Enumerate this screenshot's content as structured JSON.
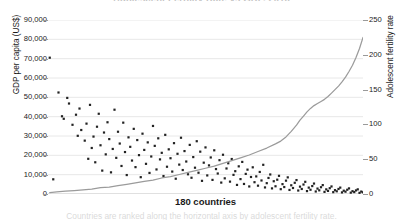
{
  "chart_data": {
    "type": "scatter",
    "title": "Adolescent Fertility Rate vs GDP, 2016",
    "xlabel": "180 countries",
    "ylabel": "GDP per capita (US$)",
    "ylabel_right": "Adolescent fertility rate",
    "caption": "Countries are ranked along the horizontal axis by adolescent fertility rate.",
    "grid": true,
    "legend_position": "none",
    "xlim": [
      0,
      180
    ],
    "ylim": [
      0,
      90000
    ],
    "ylim_right": [
      0,
      250
    ],
    "yticks": [
      "0",
      "10,000",
      "20,000",
      "30,000",
      "40,000",
      "50,000",
      "60,000",
      "70,000",
      "80,000",
      "90,000"
    ],
    "yticks_right": [
      "0",
      "50",
      "100",
      "150",
      "200",
      "250"
    ],
    "xticks": [],
    "series": [
      {
        "name": "GDP per capita (US$)",
        "type": "scatter",
        "axis": "left",
        "color": "#222222",
        "marker": "square",
        "points": [
          [
            1,
            70500
          ],
          [
            3,
            7600
          ],
          [
            6,
            52500
          ],
          [
            8,
            40200
          ],
          [
            9,
            38900
          ],
          [
            11,
            49700
          ],
          [
            12,
            46800
          ],
          [
            14,
            35800
          ],
          [
            16,
            41000
          ],
          [
            17,
            30100
          ],
          [
            18,
            44200
          ],
          [
            19,
            33100
          ],
          [
            21,
            27600
          ],
          [
            22,
            36400
          ],
          [
            23,
            18200
          ],
          [
            24,
            46100
          ],
          [
            25,
            23800
          ],
          [
            26,
            29700
          ],
          [
            27,
            16400
          ],
          [
            28,
            34800
          ],
          [
            29,
            41500
          ],
          [
            30,
            25200
          ],
          [
            31,
            12100
          ],
          [
            32,
            31800
          ],
          [
            33,
            20500
          ],
          [
            34,
            37100
          ],
          [
            35,
            28400
          ],
          [
            36,
            11200
          ],
          [
            37,
            23300
          ],
          [
            38,
            43600
          ],
          [
            39,
            18700
          ],
          [
            40,
            32200
          ],
          [
            41,
            26100
          ],
          [
            42,
            14500
          ],
          [
            43,
            36900
          ],
          [
            44,
            21700
          ],
          [
            45,
            9800
          ],
          [
            46,
            29300
          ],
          [
            47,
            24400
          ],
          [
            48,
            17300
          ],
          [
            49,
            33700
          ],
          [
            50,
            13900
          ],
          [
            51,
            27900
          ],
          [
            52,
            20100
          ],
          [
            53,
            8700
          ],
          [
            54,
            31200
          ],
          [
            55,
            22800
          ],
          [
            56,
            15600
          ],
          [
            57,
            26700
          ],
          [
            58,
            10900
          ],
          [
            59,
            19400
          ],
          [
            60,
            35200
          ],
          [
            61,
            24900
          ],
          [
            62,
            12700
          ],
          [
            63,
            28800
          ],
          [
            64,
            17900
          ],
          [
            65,
            21300
          ],
          [
            66,
            9300
          ],
          [
            67,
            30600
          ],
          [
            68,
            14100
          ],
          [
            69,
            23100
          ],
          [
            70,
            18500
          ],
          [
            71,
            11600
          ],
          [
            72,
            26300
          ],
          [
            73,
            7900
          ],
          [
            74,
            20800
          ],
          [
            75,
            15200
          ],
          [
            76,
            29100
          ],
          [
            77,
            12400
          ],
          [
            78,
            22200
          ],
          [
            79,
            16800
          ],
          [
            80,
            10200
          ],
          [
            81,
            25400
          ],
          [
            82,
            8400
          ],
          [
            83,
            19100
          ],
          [
            84,
            13600
          ],
          [
            85,
            27300
          ],
          [
            86,
            11000
          ],
          [
            87,
            21900
          ],
          [
            88,
            6800
          ],
          [
            89,
            16200
          ],
          [
            90,
            24100
          ],
          [
            91,
            9600
          ],
          [
            92,
            14800
          ],
          [
            93,
            18900
          ],
          [
            94,
            7300
          ],
          [
            95,
            22600
          ],
          [
            96,
            12900
          ],
          [
            97,
            10600
          ],
          [
            98,
            17500
          ],
          [
            99,
            5900
          ],
          [
            100,
            20300
          ],
          [
            101,
            8100
          ],
          [
            102,
            13200
          ],
          [
            103,
            15900
          ],
          [
            104,
            6400
          ],
          [
            105,
            18100
          ],
          [
            106,
            9900
          ],
          [
            107,
            11800
          ],
          [
            108,
            4700
          ],
          [
            109,
            14300
          ],
          [
            110,
            7700
          ],
          [
            111,
            16600
          ],
          [
            112,
            5200
          ],
          [
            113,
            10400
          ],
          [
            114,
            12600
          ],
          [
            115,
            3900
          ],
          [
            116,
            8800
          ],
          [
            117,
            13800
          ],
          [
            118,
            6100
          ],
          [
            119,
            9100
          ],
          [
            120,
            4300
          ],
          [
            121,
            11400
          ],
          [
            122,
            7000
          ],
          [
            123,
            15100
          ],
          [
            124,
            3400
          ],
          [
            125,
            5600
          ],
          [
            126,
            8300
          ],
          [
            127,
            10100
          ],
          [
            128,
            2900
          ],
          [
            129,
            6600
          ],
          [
            130,
            4000
          ],
          [
            131,
            7400
          ],
          [
            132,
            9400
          ],
          [
            133,
            2500
          ],
          [
            134,
            5100
          ],
          [
            135,
            3600
          ],
          [
            136,
            6900
          ],
          [
            137,
            8600
          ],
          [
            138,
            2100
          ],
          [
            139,
            4500
          ],
          [
            140,
            3100
          ],
          [
            141,
            5800
          ],
          [
            142,
            7200
          ],
          [
            143,
            1800
          ],
          [
            144,
            3800
          ],
          [
            145,
            2600
          ],
          [
            146,
            4900
          ],
          [
            147,
            6300
          ],
          [
            148,
            1500
          ],
          [
            149,
            3300
          ],
          [
            150,
            2200
          ],
          [
            151,
            4100
          ],
          [
            152,
            5400
          ],
          [
            153,
            1300
          ],
          [
            154,
            2800
          ],
          [
            155,
            1900
          ],
          [
            156,
            3500
          ],
          [
            157,
            4600
          ],
          [
            158,
            1100
          ],
          [
            159,
            2400
          ],
          [
            160,
            1600
          ],
          [
            161,
            3000
          ],
          [
            162,
            3900
          ],
          [
            163,
            950
          ],
          [
            164,
            2000
          ],
          [
            165,
            1400
          ],
          [
            166,
            2600
          ],
          [
            167,
            3300
          ],
          [
            168,
            820
          ],
          [
            169,
            1700
          ],
          [
            170,
            1200
          ],
          [
            171,
            2200
          ],
          [
            172,
            2900
          ],
          [
            173,
            700
          ],
          [
            174,
            1450
          ],
          [
            175,
            1000
          ],
          [
            176,
            1850
          ],
          [
            177,
            2400
          ],
          [
            178,
            600
          ],
          [
            179,
            1250
          ],
          [
            180,
            880
          ]
        ]
      },
      {
        "name": "Adolescent fertility rate",
        "type": "line",
        "axis": "right",
        "color": "#9b9b9b",
        "points": [
          [
            1,
            2
          ],
          [
            5,
            3
          ],
          [
            10,
            4
          ],
          [
            15,
            5
          ],
          [
            20,
            6
          ],
          [
            25,
            7
          ],
          [
            30,
            9
          ],
          [
            35,
            10
          ],
          [
            40,
            12
          ],
          [
            45,
            14
          ],
          [
            50,
            16
          ],
          [
            55,
            18
          ],
          [
            60,
            20
          ],
          [
            65,
            23
          ],
          [
            70,
            25
          ],
          [
            75,
            28
          ],
          [
            80,
            31
          ],
          [
            85,
            34
          ],
          [
            90,
            37
          ],
          [
            95,
            40
          ],
          [
            100,
            44
          ],
          [
            105,
            48
          ],
          [
            110,
            52
          ],
          [
            115,
            56
          ],
          [
            120,
            61
          ],
          [
            125,
            66
          ],
          [
            130,
            72
          ],
          [
            133,
            76
          ],
          [
            136,
            82
          ],
          [
            139,
            90
          ],
          [
            142,
            99
          ],
          [
            144,
            106
          ],
          [
            146,
            112
          ],
          [
            148,
            118
          ],
          [
            150,
            123
          ],
          [
            152,
            127
          ],
          [
            154,
            130
          ],
          [
            156,
            133
          ],
          [
            158,
            136
          ],
          [
            160,
            140
          ],
          [
            162,
            145
          ],
          [
            164,
            150
          ],
          [
            166,
            155
          ],
          [
            168,
            161
          ],
          [
            170,
            168
          ],
          [
            172,
            176
          ],
          [
            174,
            185
          ],
          [
            176,
            196
          ],
          [
            178,
            209
          ],
          [
            180,
            225
          ]
        ]
      }
    ]
  }
}
